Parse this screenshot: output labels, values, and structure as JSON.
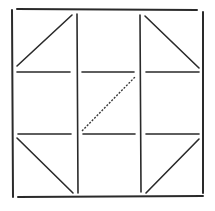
{
  "diagram": {
    "stroke_color": "#2a2a2a",
    "background": "#ffffff",
    "outer_frame": {
      "top": [
        17,
        9,
        197,
        10
      ],
      "bottom": [
        18,
        197,
        203,
        196
      ],
      "left": [
        12,
        10,
        13,
        197
      ],
      "right": [
        203,
        12,
        203,
        193
      ]
    },
    "vertical_lines": [
      [
        77,
        14,
        78,
        193
      ],
      [
        140,
        15,
        141,
        192
      ]
    ],
    "horizontal_segments": [
      [
        17,
        72,
        70,
        72
      ],
      [
        82,
        72,
        134,
        72
      ],
      [
        146,
        72,
        199,
        72
      ],
      [
        18,
        134,
        71,
        134
      ],
      [
        83,
        134,
        135,
        134
      ],
      [
        146,
        134,
        199,
        134
      ]
    ],
    "diagonals": [
      {
        "cell": "top-left",
        "coords": [
          17,
          66,
          72,
          15
        ],
        "style": "solid"
      },
      {
        "cell": "top-right",
        "coords": [
          145,
          16,
          199,
          68
        ],
        "style": "solid"
      },
      {
        "cell": "center",
        "coords": [
          82,
          131,
          136,
          76
        ],
        "style": "dashed"
      },
      {
        "cell": "bottom-left",
        "coords": [
          17,
          138,
          73,
          193
        ],
        "style": "solid"
      },
      {
        "cell": "bottom-right",
        "coords": [
          146,
          193,
          199,
          139
        ],
        "style": "solid"
      }
    ]
  }
}
